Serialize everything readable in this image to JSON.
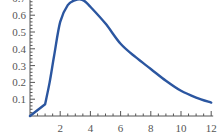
{
  "chart_data": {
    "type": "line",
    "title": "",
    "xlabel": "",
    "ylabel": "",
    "xlim": [
      0,
      12
    ],
    "ylim": [
      0,
      0.7
    ],
    "grid": false,
    "x_ticks": [
      2,
      4,
      6,
      8,
      10,
      12
    ],
    "y_ticks": [
      0.1,
      0.2,
      0.3,
      0.4,
      0.5,
      0.6,
      0.7
    ],
    "x_tick_labels": [
      "2",
      "4",
      "6",
      "8",
      "10",
      "12"
    ],
    "y_tick_labels": [
      "0.1",
      "0.2",
      "0.3",
      "0.4",
      "0.5",
      "0.6",
      "0.7"
    ],
    "series": [
      {
        "name": "curve",
        "color": "#2b56a0",
        "x": [
          0,
          1,
          1.3,
          1.6,
          2,
          2.5,
          3,
          3.3,
          3.6,
          4,
          5,
          6,
          7,
          8,
          9,
          10,
          11,
          12
        ],
        "y": [
          0,
          0.07,
          0.2,
          0.36,
          0.56,
          0.66,
          0.69,
          0.695,
          0.685,
          0.65,
          0.55,
          0.43,
          0.35,
          0.28,
          0.21,
          0.15,
          0.11,
          0.08
        ]
      }
    ]
  }
}
